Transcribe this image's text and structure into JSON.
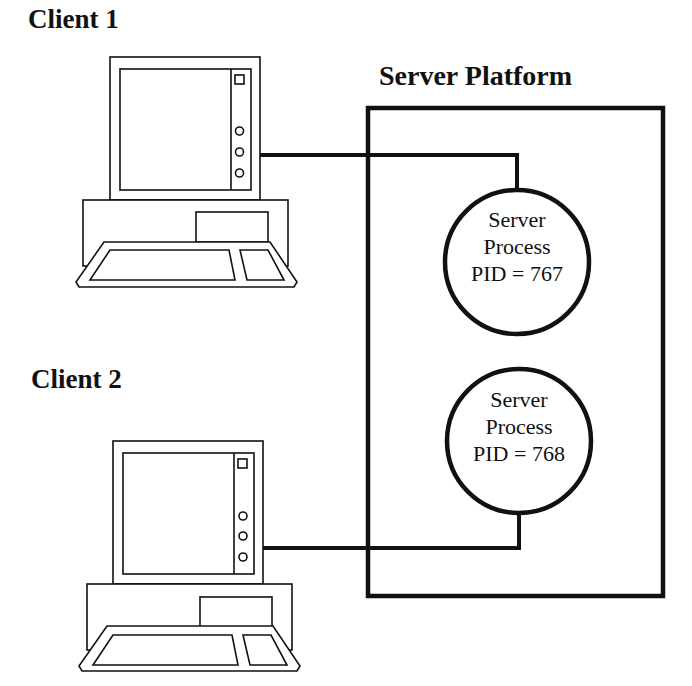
{
  "clients": [
    {
      "label": "Client 1"
    },
    {
      "label": "Client 2"
    }
  ],
  "server_platform": {
    "label": "Server Platform",
    "processes": [
      {
        "line1": "Server",
        "line2": "Process",
        "line3": "PID = 767"
      },
      {
        "line1": "Server",
        "line2": "Process",
        "line3": "PID = 768"
      }
    ]
  },
  "connections": [
    {
      "from": "Client 1",
      "to": "PID = 767"
    },
    {
      "from": "Client 2",
      "to": "PID = 768"
    }
  ],
  "colors": {
    "stroke": "#111111",
    "background": "#ffffff"
  }
}
